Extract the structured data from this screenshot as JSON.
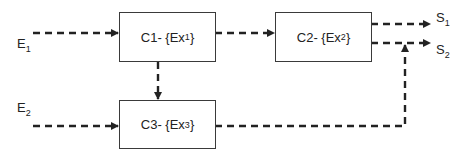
{
  "diagram": {
    "nodes": [
      {
        "id": "C1",
        "name": "C1",
        "set": "Ex",
        "sub": "1"
      },
      {
        "id": "C2",
        "name": "C2",
        "set": "Ex",
        "sub": "2"
      },
      {
        "id": "C3",
        "name": "C3",
        "set": "Ex",
        "sub": "3"
      }
    ],
    "inputs": [
      {
        "id": "E1",
        "base": "E",
        "sub": "1"
      },
      {
        "id": "E2",
        "base": "E",
        "sub": "2"
      }
    ],
    "outputs": [
      {
        "id": "S1",
        "base": "S",
        "sub": "1"
      },
      {
        "id": "S2",
        "base": "S",
        "sub": "2"
      }
    ],
    "edges": [
      {
        "from": "E1",
        "to": "C1",
        "style": "dashed"
      },
      {
        "from": "E2",
        "to": "C3",
        "style": "dashed"
      },
      {
        "from": "C1",
        "to": "C2",
        "style": "dashed"
      },
      {
        "from": "C1",
        "to": "C3",
        "style": "dashed"
      },
      {
        "from": "C2",
        "to": "S1",
        "style": "dashed"
      },
      {
        "from": "C2",
        "to": "S2",
        "style": "dashed"
      },
      {
        "from": "C3",
        "to": "S2",
        "style": "dashed"
      }
    ],
    "separator": " - {",
    "close": "}"
  }
}
